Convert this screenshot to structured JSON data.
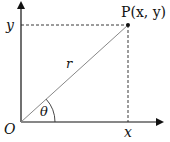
{
  "diagram": {
    "type": "polar-coordinates",
    "labels": {
      "point": "P(x, y)",
      "radius": "r",
      "angle": "θ",
      "origin": "O",
      "x_tick": "x",
      "y_tick": "y"
    },
    "colors": {
      "axis": "#111111",
      "radius_line": "#888888",
      "dashed": "#222222"
    }
  }
}
